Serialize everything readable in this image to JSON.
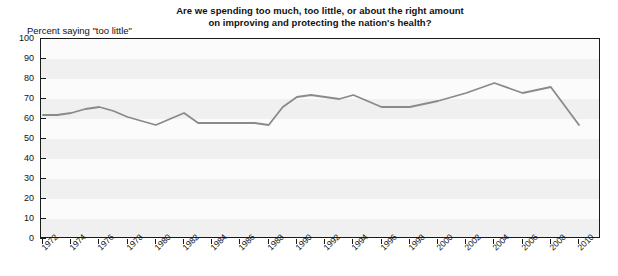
{
  "chart_data": {
    "type": "line",
    "title": "Are we spending too much, too little, or about the right amount on improving and protecting the nation's health?",
    "title_line1": "Are we spending too much, too little, or about the right amount",
    "title_line2": "on improving and protecting the nation's health?",
    "ylabel": "Percent saying \"too little\"",
    "xlabel": "",
    "ylim": [
      0,
      100
    ],
    "xlim": [
      1972,
      2010
    ],
    "yticks": [
      0,
      10,
      20,
      30,
      40,
      50,
      60,
      70,
      80,
      90,
      100
    ],
    "grid": false,
    "legend": "none",
    "series_color": "#8a8a8a",
    "categories": [
      1972,
      1973,
      1974,
      1975,
      1976,
      1977,
      1978,
      1980,
      1982,
      1983,
      1984,
      1985,
      1986,
      1987,
      1988,
      1989,
      1990,
      1991,
      1993,
      1994,
      1996,
      1998,
      2000,
      2002,
      2004,
      2006,
      2008,
      2010
    ],
    "values": [
      62,
      62,
      63,
      65,
      66,
      64,
      61,
      57,
      63,
      58,
      58,
      58,
      58,
      58,
      57,
      66,
      71,
      72,
      70,
      72,
      66,
      66,
      69,
      73,
      78,
      73,
      76,
      57
    ],
    "xtick_labels": [
      "1972",
      "1974",
      "1976",
      "1978",
      "1980",
      "1982",
      "1984",
      "1986",
      "1988",
      "1990",
      "1992",
      "1994",
      "1996",
      "1998",
      "2000",
      "2002",
      "2004",
      "2006",
      "2008",
      "2010"
    ],
    "xtick_values": [
      1972,
      1974,
      1976,
      1978,
      1980,
      1982,
      1984,
      1986,
      1988,
      1990,
      1992,
      1994,
      1996,
      1998,
      2000,
      2002,
      2004,
      2006,
      2008,
      2010
    ]
  }
}
